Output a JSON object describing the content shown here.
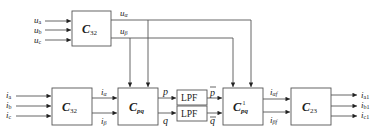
{
  "diagram": {
    "type": "block-diagram",
    "blocks": {
      "c32_voltage": {
        "main": "C",
        "sub": "32"
      },
      "c32_current": {
        "main": "C",
        "sub": "32"
      },
      "cpq": {
        "main": "C",
        "sub": "pq"
      },
      "lpf_p": {
        "label": "LPF"
      },
      "lpf_q": {
        "label": "LPF"
      },
      "cpq_inv": {
        "main": "C",
        "sub": "pq",
        "sup": "−1"
      },
      "c23": {
        "main": "C",
        "sub": "23"
      }
    },
    "inputs_voltage": [
      {
        "main": "u",
        "sub": "a"
      },
      {
        "main": "u",
        "sub": "b"
      },
      {
        "main": "u",
        "sub": "c"
      }
    ],
    "inputs_current": [
      {
        "main": "i",
        "sub": "a"
      },
      {
        "main": "i",
        "sub": "b"
      },
      {
        "main": "i",
        "sub": "c"
      }
    ],
    "signals": {
      "u_alpha": {
        "main": "u",
        "sub": "α"
      },
      "u_beta": {
        "main": "u",
        "sub": "β"
      },
      "i_alpha": {
        "main": "i",
        "sub": "α"
      },
      "i_beta": {
        "main": "i",
        "sub": "β"
      },
      "p": {
        "main": "p"
      },
      "q": {
        "main": "q"
      },
      "p_bar": {
        "main": "p"
      },
      "q_bar": {
        "main": "q"
      },
      "i_alpha_f": {
        "main": "i",
        "sub": "αf"
      },
      "i_beta_f": {
        "main": "i",
        "sub": "βf"
      }
    },
    "outputs": [
      {
        "main": "i",
        "sub": "a1"
      },
      {
        "main": "i",
        "sub": "b1"
      },
      {
        "main": "i",
        "sub": "c1"
      }
    ]
  }
}
